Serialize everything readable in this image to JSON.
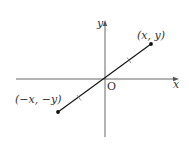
{
  "diagram": {
    "type": "coordinate-plane",
    "axes": {
      "x_label": "x",
      "y_label": "y",
      "origin_label": "O"
    },
    "points": [
      {
        "id": "p1",
        "label": "(x, y)",
        "quadrant": "I"
      },
      {
        "id": "p2",
        "label": "(−x, −y)",
        "quadrant": "III"
      }
    ],
    "segment": {
      "from": "p2",
      "to": "p1",
      "passes_through": "O",
      "equal_length_marks": 2
    }
  }
}
